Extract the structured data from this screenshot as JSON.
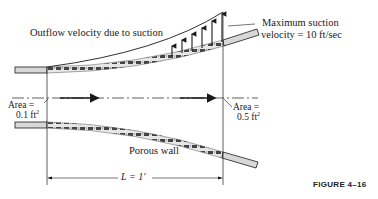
{
  "figure": {
    "caption": "FIGURE 4–16",
    "labels": {
      "outflow": "Outflow velocity due to suction",
      "max_suction_line1": "Maximum suction",
      "max_suction_line2": "velocity = 10 ft/sec",
      "area_inlet_line1": "Area =",
      "area_inlet_value": "0.1 ft",
      "area_inlet_exp": "2",
      "area_outlet_line1": "Area =",
      "area_outlet_value": "0.5 ft",
      "area_outlet_exp": "2",
      "porous_wall": "Porous wall",
      "length": "L = 1′"
    },
    "colors": {
      "line": "#1a1a1a",
      "pipe_fill": "#d8d8d8",
      "porous_fill": "#bdbdbd",
      "background": "#ffffff"
    }
  }
}
